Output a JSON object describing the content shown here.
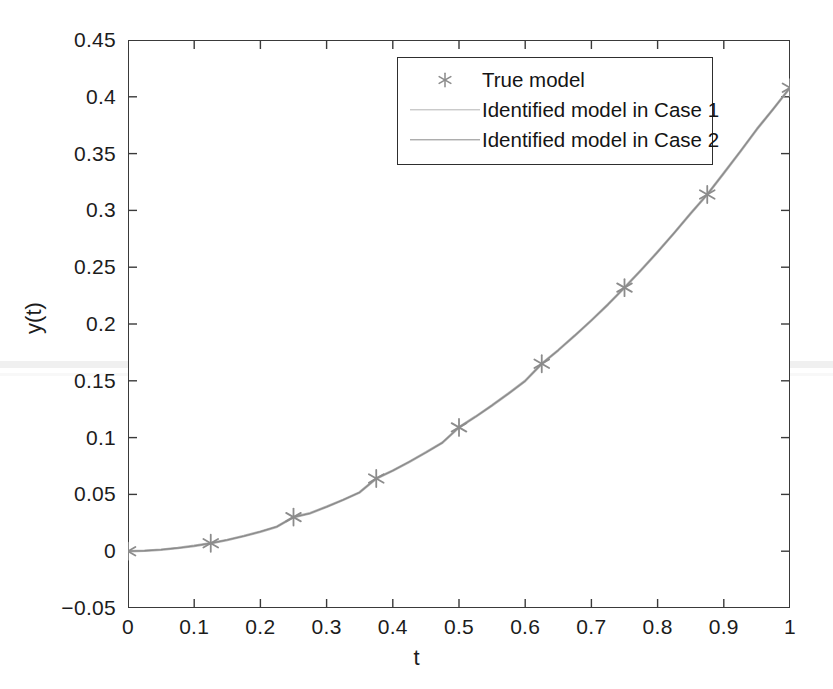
{
  "chart_data": {
    "type": "line",
    "title": "",
    "xlabel": "t",
    "ylabel": "y(t)",
    "xlim": [
      0,
      1
    ],
    "ylim": [
      -0.05,
      0.45
    ],
    "grid": false,
    "legend_position": "top-center",
    "x_ticks": [
      "0",
      "0.1",
      "0.2",
      "0.3",
      "0.4",
      "0.5",
      "0.6",
      "0.7",
      "0.8",
      "0.9",
      "1"
    ],
    "x_tick_values": [
      0,
      0.1,
      0.2,
      0.3,
      0.4,
      0.5,
      0.6,
      0.7,
      0.8,
      0.9,
      1
    ],
    "y_ticks": [
      "-0.05",
      "0",
      "0.05",
      "0.1",
      "0.15",
      "0.2",
      "0.25",
      "0.3",
      "0.35",
      "0.4",
      "0.45"
    ],
    "y_tick_values": [
      -0.05,
      0,
      0.05,
      0.1,
      0.15,
      0.2,
      0.25,
      0.3,
      0.35,
      0.4,
      0.45
    ],
    "x": [
      0,
      0.125,
      0.25,
      0.375,
      0.5,
      0.625,
      0.75,
      0.875,
      1
    ],
    "series": [
      {
        "name": "True model",
        "style": "marker",
        "marker": "star",
        "color": "#8c8c8c",
        "values": [
          0.0,
          0.007,
          0.03,
          0.064,
          0.109,
          0.165,
          0.232,
          0.314,
          0.408
        ]
      },
      {
        "name": "Identified model in Case 1",
        "style": "line",
        "color": "#b4b4b4",
        "values": [
          0.0,
          0.007,
          0.03,
          0.064,
          0.109,
          0.165,
          0.232,
          0.314,
          0.408
        ]
      },
      {
        "name": "Identified model in Case 2",
        "style": "line",
        "color": "#8a8a8a",
        "values": [
          0.0,
          0.007,
          0.03,
          0.064,
          0.109,
          0.165,
          0.232,
          0.314,
          0.408
        ]
      }
    ],
    "curve_dense": {
      "x": [
        0,
        0.025,
        0.05,
        0.075,
        0.1,
        0.125,
        0.15,
        0.175,
        0.2,
        0.225,
        0.25,
        0.275,
        0.3,
        0.325,
        0.35,
        0.375,
        0.4,
        0.425,
        0.45,
        0.475,
        0.5,
        0.525,
        0.55,
        0.575,
        0.6,
        0.625,
        0.65,
        0.675,
        0.7,
        0.725,
        0.75,
        0.775,
        0.8,
        0.825,
        0.85,
        0.875,
        0.9,
        0.925,
        0.95,
        0.975,
        1
      ],
      "y": [
        0.0,
        0.0004,
        0.0013,
        0.0028,
        0.0047,
        0.007,
        0.0099,
        0.0133,
        0.0172,
        0.0216,
        0.03,
        0.0334,
        0.0391,
        0.0452,
        0.0518,
        0.064,
        0.0709,
        0.0787,
        0.0869,
        0.0956,
        0.109,
        0.1184,
        0.1284,
        0.1389,
        0.1499,
        0.165,
        0.177,
        0.1898,
        0.2032,
        0.2172,
        0.232,
        0.2474,
        0.2634,
        0.2801,
        0.2974,
        0.314,
        0.3328,
        0.3519,
        0.3715,
        0.3895,
        0.408
      ]
    }
  },
  "legend": {
    "entries": [
      {
        "label": "True model"
      },
      {
        "label": "Identified model in Case 1"
      },
      {
        "label": "Identified model in Case 2"
      }
    ]
  },
  "axis": {
    "x_title": "t",
    "y_title": "y(t)"
  },
  "colors": {
    "axis": "#3a3a3a",
    "case1": "#b4b4b4",
    "case2": "#8a8a8a",
    "marker": "#8c8c8c",
    "background": "#ffffff"
  }
}
